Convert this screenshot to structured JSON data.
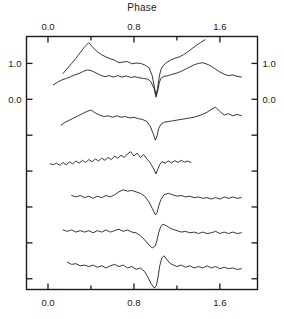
{
  "figure": {
    "title": "Phase",
    "background_color": "#ffffff",
    "line_color": "#141414",
    "axis_color": "#1a1a1a"
  },
  "chart_data": {
    "type": "line",
    "title": "Phase",
    "xlabel": "Phase",
    "ylabel": "",
    "xlim": [
      -0.2,
      1.95
    ],
    "ylim": [
      -5.3,
      1.75
    ],
    "grid": false,
    "legend": null,
    "xticks": [
      0.0,
      0.8,
      1.6
    ],
    "xtick_labels": [
      "0.0",
      "0.8",
      "1.6"
    ],
    "xminor_ticks": [
      0.4,
      1.2
    ],
    "yticks": [
      1.0,
      0.0,
      -1.0,
      -2.0,
      -3.0,
      -4.0,
      -5.0
    ],
    "ytick_labels": [
      "1.0",
      "0.0",
      "",
      "",
      "",
      "",
      ""
    ],
    "yticks_labeled": [
      1.0,
      0.0
    ],
    "ytick_labels_left": [
      "1.0",
      "0.0"
    ],
    "ytick_labels_right": [
      "1.0",
      "0.0"
    ],
    "series": [
      {
        "name": "curve-1",
        "offset": 1.0,
        "x": [
          0.14,
          0.18,
          0.22,
          0.26,
          0.3,
          0.34,
          0.38,
          0.42,
          0.46,
          0.5,
          0.54,
          0.58,
          0.62,
          0.66,
          0.7,
          0.74,
          0.78,
          0.82,
          0.86,
          0.9,
          0.94,
          0.97,
          0.99,
          1.005,
          1.02,
          1.035,
          1.05,
          1.07,
          1.1,
          1.14,
          1.18,
          1.22,
          1.26,
          1.3,
          1.34,
          1.38,
          1.42,
          1.46
        ],
        "y": [
          0.72,
          0.86,
          1.0,
          1.14,
          1.3,
          1.46,
          1.58,
          1.44,
          1.32,
          1.24,
          1.18,
          1.13,
          1.09,
          1.02,
          1.04,
          1.05,
          0.99,
          1.01,
          1.0,
          0.96,
          0.88,
          0.66,
          0.34,
          0.12,
          0.3,
          0.62,
          0.82,
          0.93,
          1.02,
          1.09,
          1.14,
          1.18,
          1.24,
          1.32,
          1.41,
          1.5,
          1.58,
          1.66
        ]
      },
      {
        "name": "curve-2",
        "offset": 0.0,
        "x": [
          0.05,
          0.09,
          0.13,
          0.17,
          0.21,
          0.25,
          0.29,
          0.33,
          0.37,
          0.41,
          0.45,
          0.49,
          0.53,
          0.57,
          0.61,
          0.65,
          0.69,
          0.73,
          0.77,
          0.81,
          0.85,
          0.89,
          0.93,
          0.96,
          0.99,
          1.005,
          1.02,
          1.035,
          1.05,
          1.08,
          1.12,
          1.16,
          1.2,
          1.24,
          1.28,
          1.32,
          1.36,
          1.4,
          1.44,
          1.48,
          1.52,
          1.56,
          1.6,
          1.64,
          1.68,
          1.72,
          1.76,
          1.8
        ],
        "y": [
          0.4,
          0.48,
          0.54,
          0.58,
          0.63,
          0.68,
          0.72,
          0.78,
          0.82,
          0.79,
          0.73,
          0.67,
          0.63,
          0.66,
          0.62,
          0.66,
          0.62,
          0.65,
          0.61,
          0.63,
          0.6,
          0.58,
          0.56,
          0.48,
          0.28,
          0.06,
          0.22,
          0.45,
          0.58,
          0.64,
          0.66,
          0.7,
          0.73,
          0.78,
          0.84,
          0.9,
          0.96,
          1.0,
          1.02,
          0.98,
          0.92,
          0.84,
          0.76,
          0.7,
          0.66,
          0.68,
          0.64,
          0.62
        ]
      },
      {
        "name": "curve-3",
        "offset": -1.0,
        "x": [
          0.12,
          0.16,
          0.2,
          0.24,
          0.28,
          0.32,
          0.36,
          0.4,
          0.44,
          0.48,
          0.52,
          0.56,
          0.6,
          0.64,
          0.68,
          0.72,
          0.76,
          0.8,
          0.84,
          0.88,
          0.92,
          0.95,
          0.98,
          1.0,
          1.015,
          1.03,
          1.05,
          1.08,
          1.12,
          1.16,
          1.2,
          1.24,
          1.28,
          1.32,
          1.36,
          1.4,
          1.44,
          1.48,
          1.52,
          1.56,
          1.6,
          1.64,
          1.68,
          1.72,
          1.76,
          1.8
        ],
        "y": [
          -0.72,
          -0.64,
          -0.58,
          -0.52,
          -0.46,
          -0.4,
          -0.34,
          -0.3,
          -0.38,
          -0.44,
          -0.48,
          -0.46,
          -0.5,
          -0.46,
          -0.5,
          -0.48,
          -0.52,
          -0.5,
          -0.54,
          -0.56,
          -0.62,
          -0.74,
          -0.96,
          -1.14,
          -1.02,
          -0.82,
          -0.7,
          -0.64,
          -0.62,
          -0.6,
          -0.58,
          -0.56,
          -0.54,
          -0.52,
          -0.5,
          -0.46,
          -0.42,
          -0.36,
          -0.28,
          -0.22,
          -0.34,
          -0.44,
          -0.4,
          -0.46,
          -0.42,
          -0.46
        ]
      },
      {
        "name": "curve-4",
        "offset": -2.0,
        "noisy": true,
        "x": [
          0.02,
          0.05,
          0.08,
          0.11,
          0.14,
          0.17,
          0.2,
          0.23,
          0.26,
          0.29,
          0.32,
          0.35,
          0.38,
          0.41,
          0.44,
          0.47,
          0.5,
          0.53,
          0.56,
          0.59,
          0.62,
          0.65,
          0.68,
          0.71,
          0.74,
          0.77,
          0.8,
          0.83,
          0.86,
          0.89,
          0.92,
          0.95,
          0.98,
          1.005,
          1.02,
          1.04,
          1.06,
          1.09,
          1.12,
          1.15,
          1.18,
          1.21,
          1.24,
          1.27,
          1.3,
          1.33
        ],
        "y": [
          -1.8,
          -1.82,
          -1.78,
          -1.84,
          -1.76,
          -1.83,
          -1.74,
          -1.8,
          -1.72,
          -1.78,
          -1.7,
          -1.76,
          -1.68,
          -1.74,
          -1.66,
          -1.72,
          -1.64,
          -1.7,
          -1.62,
          -1.68,
          -1.58,
          -1.64,
          -1.56,
          -1.62,
          -1.52,
          -1.46,
          -1.58,
          -1.5,
          -1.62,
          -1.54,
          -1.66,
          -1.76,
          -1.92,
          -2.08,
          -1.96,
          -1.82,
          -1.74,
          -1.78,
          -1.72,
          -1.77,
          -1.71,
          -1.76,
          -1.7,
          -1.75,
          -1.72,
          -1.76
        ]
      },
      {
        "name": "curve-5",
        "offset": -3.0,
        "x": [
          0.22,
          0.26,
          0.3,
          0.34,
          0.38,
          0.42,
          0.46,
          0.5,
          0.54,
          0.58,
          0.62,
          0.66,
          0.7,
          0.74,
          0.78,
          0.82,
          0.86,
          0.9,
          0.94,
          0.97,
          1.0,
          1.015,
          1.03,
          1.05,
          1.08,
          1.12,
          1.16,
          1.2,
          1.24,
          1.28,
          1.32,
          1.36,
          1.4,
          1.44,
          1.48,
          1.52,
          1.56,
          1.6,
          1.64,
          1.68,
          1.72,
          1.76,
          1.8
        ],
        "y": [
          -2.68,
          -2.72,
          -2.68,
          -2.74,
          -2.7,
          -2.76,
          -2.7,
          -2.74,
          -2.68,
          -2.72,
          -2.66,
          -2.58,
          -2.52,
          -2.56,
          -2.54,
          -2.58,
          -2.62,
          -2.7,
          -2.86,
          -3.04,
          -3.22,
          -3.16,
          -2.98,
          -2.8,
          -2.66,
          -2.62,
          -2.66,
          -2.7,
          -2.68,
          -2.72,
          -2.7,
          -2.74,
          -2.72,
          -2.76,
          -2.74,
          -2.78,
          -2.74,
          -2.78,
          -2.72,
          -2.76,
          -2.72,
          -2.76,
          -2.74
        ]
      },
      {
        "name": "curve-6",
        "offset": -4.0,
        "x": [
          0.14,
          0.18,
          0.22,
          0.26,
          0.3,
          0.34,
          0.38,
          0.42,
          0.46,
          0.5,
          0.54,
          0.58,
          0.62,
          0.66,
          0.7,
          0.74,
          0.78,
          0.82,
          0.86,
          0.9,
          0.94,
          0.97,
          1.0,
          1.015,
          1.03,
          1.05,
          1.07,
          1.1,
          1.13,
          1.16,
          1.2,
          1.24,
          1.28,
          1.32,
          1.36,
          1.4,
          1.44,
          1.48,
          1.52,
          1.56,
          1.6,
          1.64,
          1.68,
          1.72,
          1.76,
          1.8
        ],
        "y": [
          -3.64,
          -3.68,
          -3.64,
          -3.7,
          -3.66,
          -3.7,
          -3.66,
          -3.72,
          -3.66,
          -3.7,
          -3.64,
          -3.7,
          -3.66,
          -3.62,
          -3.68,
          -3.64,
          -3.7,
          -3.72,
          -3.8,
          -3.92,
          -4.06,
          -4.14,
          -4.08,
          -3.92,
          -3.72,
          -3.54,
          -3.48,
          -3.52,
          -3.58,
          -3.62,
          -3.66,
          -3.7,
          -3.68,
          -3.72,
          -3.7,
          -3.74,
          -3.7,
          -3.74,
          -3.72,
          -3.68,
          -3.74,
          -3.7,
          -3.74,
          -3.7,
          -3.74,
          -3.72
        ]
      },
      {
        "name": "curve-7",
        "offset": -5.0,
        "x": [
          0.18,
          0.22,
          0.26,
          0.3,
          0.34,
          0.38,
          0.42,
          0.46,
          0.5,
          0.54,
          0.58,
          0.62,
          0.66,
          0.7,
          0.74,
          0.78,
          0.82,
          0.86,
          0.9,
          0.93,
          0.96,
          0.99,
          1.01,
          1.025,
          1.04,
          1.06,
          1.08,
          1.11,
          1.14,
          1.17,
          1.2,
          1.24,
          1.28,
          1.32,
          1.36,
          1.4,
          1.44,
          1.48,
          1.52,
          1.56,
          1.6,
          1.64,
          1.68,
          1.72,
          1.76,
          1.8
        ],
        "y": [
          -4.54,
          -4.6,
          -4.58,
          -4.64,
          -4.62,
          -4.66,
          -4.62,
          -4.68,
          -4.64,
          -4.7,
          -4.64,
          -4.6,
          -4.66,
          -4.62,
          -4.7,
          -4.66,
          -4.74,
          -4.7,
          -4.8,
          -4.96,
          -5.14,
          -5.26,
          -5.18,
          -4.94,
          -4.64,
          -4.42,
          -4.36,
          -4.48,
          -4.58,
          -4.62,
          -4.66,
          -4.62,
          -4.68,
          -4.64,
          -4.7,
          -4.66,
          -4.7,
          -4.64,
          -4.7,
          -4.66,
          -4.72,
          -4.68,
          -4.72,
          -4.7,
          -4.74,
          -4.72
        ]
      }
    ]
  }
}
